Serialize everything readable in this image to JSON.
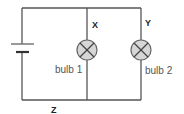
{
  "diagram": {
    "type": "circuit",
    "components": {
      "battery": {
        "label": ""
      },
      "bulb1": {
        "label": "bulb 1"
      },
      "bulb2": {
        "label": "bulb 2"
      }
    },
    "points": {
      "x": "X",
      "y": "Y",
      "z": "Z"
    },
    "colors": {
      "wire": "#444444",
      "bulb_fill": "#d6d6d6",
      "bulb_stroke": "#666666",
      "label": "#555555"
    }
  }
}
